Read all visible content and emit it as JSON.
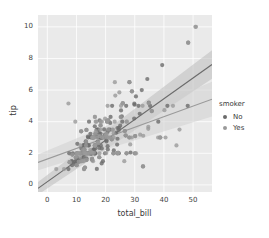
{
  "chart_data": {
    "type": "scatter",
    "title": "",
    "xlabel": "total_bill",
    "ylabel": "tip",
    "xlim": [
      -3.2,
      56.5
    ],
    "ylim": [
      -0.45,
      10.75
    ],
    "xticks": [
      0,
      10,
      20,
      30,
      40,
      50
    ],
    "yticks": [
      0,
      2,
      4,
      6,
      8,
      10
    ],
    "xtick_labels": [
      "0",
      "10",
      "20",
      "30",
      "40",
      "50"
    ],
    "ytick_labels": [
      "0",
      "2",
      "4",
      "6",
      "8",
      "10"
    ],
    "grid": true,
    "grid_color": "#ffffff",
    "panel_color": "#eaeaea",
    "legend": {
      "title": "smoker",
      "position": "right",
      "entries": [
        {
          "label": "No",
          "color": "#6b6b6b"
        },
        {
          "label": "Yes",
          "color": "#9a9a9a"
        }
      ]
    },
    "series": [
      {
        "name": "No",
        "color": "#6b6b6b",
        "regression": {
          "line_color": "#6b6b6b",
          "band_color": "#bcbcbc",
          "x_start": -3.2,
          "x_end": 56.5,
          "y_start": -0.22,
          "y_end": 7.62,
          "band_lower_start": -0.62,
          "band_lower_end": 6.72,
          "band_upper_start": 0.18,
          "band_upper_end": 8.52
        },
        "points": [
          [
            16.99,
            1.01
          ],
          [
            10.34,
            1.66
          ],
          [
            21.01,
            3.5
          ],
          [
            23.68,
            3.31
          ],
          [
            24.59,
            3.61
          ],
          [
            25.29,
            4.71
          ],
          [
            8.77,
            2.0
          ],
          [
            26.88,
            3.12
          ],
          [
            15.04,
            1.96
          ],
          [
            14.78,
            3.23
          ],
          [
            10.27,
            1.71
          ],
          [
            35.26,
            5.0
          ],
          [
            15.42,
            1.57
          ],
          [
            18.43,
            3.0
          ],
          [
            14.83,
            3.02
          ],
          [
            21.58,
            3.92
          ],
          [
            10.33,
            1.67
          ],
          [
            16.29,
            3.71
          ],
          [
            16.97,
            3.5
          ],
          [
            20.65,
            3.35
          ],
          [
            17.92,
            4.08
          ],
          [
            20.29,
            2.75
          ],
          [
            15.77,
            2.23
          ],
          [
            39.42,
            7.58
          ],
          [
            19.82,
            3.18
          ],
          [
            17.81,
            2.34
          ],
          [
            13.37,
            2.0
          ],
          [
            12.69,
            2.0
          ],
          [
            21.7,
            4.3
          ],
          [
            19.65,
            3.0
          ],
          [
            9.55,
            1.45
          ],
          [
            18.35,
            2.5
          ],
          [
            15.06,
            3.0
          ],
          [
            20.69,
            2.45
          ],
          [
            17.78,
            3.27
          ],
          [
            24.06,
            3.6
          ],
          [
            16.31,
            2.0
          ],
          [
            16.93,
            3.07
          ],
          [
            18.69,
            2.31
          ],
          [
            31.27,
            5.0
          ],
          [
            16.04,
            2.24
          ],
          [
            17.46,
            2.54
          ],
          [
            13.94,
            3.06
          ],
          [
            9.68,
            1.32
          ],
          [
            30.4,
            5.6
          ],
          [
            18.29,
            3.0
          ],
          [
            22.23,
            5.0
          ],
          [
            32.4,
            6.0
          ],
          [
            28.55,
            2.05
          ],
          [
            18.04,
            3.0
          ],
          [
            12.54,
            2.5
          ],
          [
            10.29,
            2.6
          ],
          [
            34.81,
            5.2
          ],
          [
            9.94,
            1.56
          ],
          [
            25.56,
            4.34
          ],
          [
            19.49,
            3.51
          ],
          [
            18.78,
            3.0
          ],
          [
            20.92,
            4.08
          ],
          [
            15.36,
            1.64
          ],
          [
            20.49,
            4.06
          ],
          [
            25.21,
            4.29
          ],
          [
            18.24,
            3.76
          ],
          [
            14.31,
            4.0
          ],
          [
            14.0,
            3.0
          ],
          [
            7.25,
            1.0
          ],
          [
            38.07,
            4.0
          ],
          [
            23.95,
            2.55
          ],
          [
            25.71,
            4.0
          ],
          [
            17.31,
            3.5
          ],
          [
            29.93,
            5.07
          ],
          [
            10.65,
            1.5
          ],
          [
            12.43,
            1.8
          ],
          [
            24.08,
            2.92
          ],
          [
            11.69,
            2.31
          ],
          [
            13.42,
            1.68
          ],
          [
            14.26,
            2.5
          ],
          [
            15.95,
            2.0
          ],
          [
            12.48,
            2.52
          ],
          [
            29.8,
            4.2
          ],
          [
            8.52,
            1.48
          ],
          [
            14.52,
            2.0
          ],
          [
            11.38,
            2.0
          ],
          [
            22.82,
            2.18
          ],
          [
            19.08,
            1.5
          ],
          [
            20.27,
            2.83
          ],
          [
            11.17,
            1.5
          ],
          [
            12.26,
            2.0
          ],
          [
            18.26,
            3.25
          ],
          [
            8.51,
            1.25
          ],
          [
            10.33,
            2.0
          ],
          [
            14.15,
            2.0
          ],
          [
            13.16,
            2.75
          ],
          [
            17.47,
            3.5
          ],
          [
            34.3,
            6.7
          ],
          [
            41.19,
            5.0
          ],
          [
            27.05,
            5.0
          ],
          [
            16.43,
            2.3
          ],
          [
            8.35,
            1.5
          ],
          [
            18.64,
            1.36
          ],
          [
            11.87,
            1.63
          ],
          [
            9.78,
            1.73
          ],
          [
            7.51,
            2.0
          ],
          [
            14.07,
            2.5
          ],
          [
            13.13,
            2.0
          ],
          [
            17.26,
            2.74
          ],
          [
            24.55,
            2.0
          ],
          [
            19.77,
            2.0
          ],
          [
            29.85,
            5.14
          ],
          [
            48.17,
            5.0
          ],
          [
            25.0,
            3.75
          ],
          [
            13.39,
            2.61
          ],
          [
            16.49,
            2.0
          ],
          [
            21.5,
            3.5
          ],
          [
            12.66,
            2.5
          ],
          [
            16.21,
            2.0
          ],
          [
            13.81,
            2.0
          ],
          [
            17.51,
            3.0
          ],
          [
            24.52,
            3.48
          ],
          [
            20.76,
            2.24
          ],
          [
            31.71,
            4.5
          ],
          [
            16.4,
            2.5
          ],
          [
            20.53,
            4.0
          ],
          [
            16.47,
            3.23
          ],
          [
            26.59,
            3.41
          ],
          [
            38.73,
            3.0
          ],
          [
            24.27,
            2.03
          ],
          [
            12.76,
            2.23
          ],
          [
            30.06,
            2.0
          ],
          [
            25.89,
            5.16
          ],
          [
            48.33,
            9.0
          ],
          [
            13.27,
            2.5
          ],
          [
            28.17,
            6.5
          ],
          [
            12.9,
            1.1
          ],
          [
            28.15,
            3.0
          ],
          [
            11.59,
            1.5
          ],
          [
            7.74,
            1.44
          ],
          [
            30.14,
            3.09
          ],
          [
            12.16,
            2.2
          ],
          [
            13.42,
            3.48
          ],
          [
            8.58,
            1.92
          ],
          [
            15.98,
            3.0
          ],
          [
            13.42,
            1.58
          ],
          [
            16.27,
            2.5
          ],
          [
            10.09,
            2.0
          ],
          [
            20.45,
            3.0
          ],
          [
            13.28,
            2.72
          ],
          [
            22.12,
            2.88
          ],
          [
            24.01,
            2.0
          ],
          [
            15.69,
            3.0
          ],
          [
            11.61,
            3.39
          ],
          [
            10.77,
            1.47
          ],
          [
            15.53,
            3.0
          ],
          [
            10.07,
            1.25
          ],
          [
            12.6,
            1.0
          ],
          [
            32.83,
            1.17
          ],
          [
            35.83,
            4.67
          ],
          [
            29.03,
            5.92
          ],
          [
            27.18,
            2.0
          ],
          [
            22.67,
            2.0
          ],
          [
            17.82,
            1.75
          ],
          [
            18.78,
            3.0
          ]
        ]
      },
      {
        "name": "Yes",
        "color": "#9a9a9a",
        "regression": {
          "line_color": "#9a9a9a",
          "band_color": "#cfcfcf",
          "x_start": -3.2,
          "x_end": 56.5,
          "y_start": 1.42,
          "y_end": 5.42,
          "band_lower_start": 0.92,
          "band_lower_end": 4.32,
          "band_upper_start": 1.92,
          "band_upper_end": 6.52
        },
        "points": [
          [
            38.01,
            3.0
          ],
          [
            11.24,
            1.76
          ],
          [
            20.29,
            3.21
          ],
          [
            13.81,
            2.0
          ],
          [
            11.02,
            1.98
          ],
          [
            18.29,
            3.76
          ],
          [
            17.59,
            2.64
          ],
          [
            20.08,
            3.15
          ],
          [
            16.45,
            2.47
          ],
          [
            3.07,
            1.0
          ],
          [
            20.23,
            2.01
          ],
          [
            15.01,
            2.09
          ],
          [
            12.02,
            1.97
          ],
          [
            17.07,
            3.0
          ],
          [
            26.86,
            3.14
          ],
          [
            25.28,
            5.0
          ],
          [
            14.73,
            2.2
          ],
          [
            10.51,
            2.0
          ],
          [
            17.92,
            3.08
          ],
          [
            27.2,
            4.0
          ],
          [
            22.76,
            3.0
          ],
          [
            17.29,
            2.71
          ],
          [
            19.44,
            3.0
          ],
          [
            16.66,
            3.4
          ],
          [
            10.07,
            1.83
          ],
          [
            32.68,
            5.0
          ],
          [
            15.98,
            2.03
          ],
          [
            34.83,
            5.17
          ],
          [
            13.03,
            2.0
          ],
          [
            18.28,
            4.0
          ],
          [
            24.71,
            5.85
          ],
          [
            21.16,
            3.0
          ],
          [
            28.97,
            3.0
          ],
          [
            22.49,
            3.5
          ],
          [
            5.75,
            1.0
          ],
          [
            16.32,
            4.3
          ],
          [
            22.75,
            3.25
          ],
          [
            40.17,
            4.73
          ],
          [
            27.28,
            4.0
          ],
          [
            12.03,
            1.5
          ],
          [
            21.01,
            3.0
          ],
          [
            12.46,
            1.5
          ],
          [
            11.35,
            2.5
          ],
          [
            15.38,
            3.0
          ],
          [
            44.3,
            2.5
          ],
          [
            22.42,
            3.48
          ],
          [
            20.92,
            4.08
          ],
          [
            15.36,
            1.64
          ],
          [
            20.49,
            4.06
          ],
          [
            25.21,
            4.29
          ],
          [
            16.32,
            4.3
          ],
          [
            8.58,
            1.92
          ],
          [
            15.98,
            3.0
          ],
          [
            13.42,
            1.58
          ],
          [
            16.27,
            2.5
          ],
          [
            10.09,
            2.0
          ],
          [
            20.45,
            3.0
          ],
          [
            13.28,
            2.72
          ],
          [
            22.12,
            2.88
          ],
          [
            24.01,
            2.0
          ],
          [
            15.69,
            3.0
          ],
          [
            11.61,
            3.39
          ],
          [
            10.77,
            1.47
          ],
          [
            15.53,
            3.0
          ],
          [
            10.07,
            1.25
          ],
          [
            12.6,
            1.0
          ],
          [
            32.83,
            1.17
          ],
          [
            35.83,
            4.67
          ],
          [
            29.03,
            5.92
          ],
          [
            27.18,
            2.0
          ],
          [
            22.67,
            2.0
          ],
          [
            17.82,
            1.75
          ],
          [
            18.78,
            3.0
          ],
          [
            7.25,
            5.15
          ],
          [
            31.85,
            3.18
          ],
          [
            16.82,
            4.0
          ],
          [
            32.9,
            3.11
          ],
          [
            17.89,
            2.0
          ],
          [
            14.48,
            2.0
          ],
          [
            9.6,
            4.0
          ],
          [
            34.63,
            3.55
          ],
          [
            34.65,
            3.68
          ],
          [
            23.33,
            5.65
          ],
          [
            45.35,
            3.5
          ],
          [
            23.17,
            6.5
          ],
          [
            40.55,
            3.0
          ],
          [
            20.69,
            5.0
          ],
          [
            20.9,
            3.5
          ],
          [
            30.46,
            2.0
          ],
          [
            18.15,
            3.5
          ],
          [
            23.1,
            4.0
          ],
          [
            15.69,
            1.5
          ],
          [
            19.81,
            4.19
          ],
          [
            28.44,
            2.56
          ],
          [
            15.48,
            2.02
          ],
          [
            16.58,
            4.0
          ],
          [
            7.56,
            1.44
          ],
          [
            10.34,
            2.0
          ],
          [
            43.11,
            5.0
          ],
          [
            13.0,
            2.0
          ],
          [
            13.51,
            2.0
          ],
          [
            18.71,
            4.0
          ],
          [
            12.74,
            2.01
          ],
          [
            13.0,
            2.0
          ],
          [
            16.4,
            2.5
          ],
          [
            20.53,
            4.0
          ],
          [
            16.47,
            3.23
          ],
          [
            26.59,
            3.41
          ],
          [
            38.73,
            3.0
          ],
          [
            24.27,
            2.03
          ],
          [
            12.76,
            2.23
          ],
          [
            30.06,
            2.0
          ],
          [
            25.89,
            5.16
          ],
          [
            48.33,
            9.0
          ],
          [
            13.27,
            2.5
          ],
          [
            28.17,
            6.5
          ],
          [
            12.9,
            1.1
          ],
          [
            28.15,
            3.0
          ],
          [
            11.59,
            1.5
          ],
          [
            7.74,
            1.44
          ],
          [
            30.14,
            3.09
          ],
          [
            12.16,
            2.2
          ],
          [
            13.42,
            3.48
          ],
          [
            50.81,
            10.0
          ],
          [
            51.0,
            10.0
          ],
          [
            9.78,
            1.73
          ],
          [
            25.89,
            5.16
          ],
          [
            26.41,
            1.5
          ],
          [
            38.73,
            3.0
          ],
          [
            24.27,
            2.03
          ]
        ]
      }
    ]
  }
}
